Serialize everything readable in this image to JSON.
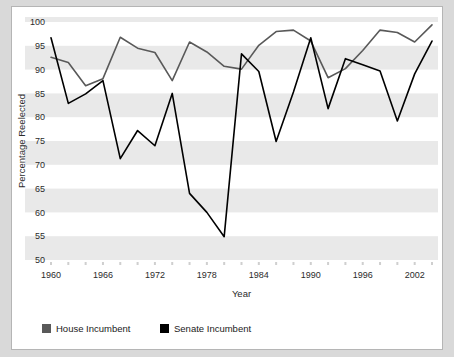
{
  "chart_data": {
    "type": "line",
    "title": "",
    "xlabel": "Year",
    "ylabel": "Percentage Reelected",
    "xlim": [
      1960,
      2004
    ],
    "ylim": [
      50,
      100
    ],
    "yticks": [
      50,
      55,
      60,
      65,
      70,
      75,
      80,
      85,
      90,
      95,
      100
    ],
    "xticks": [
      1960,
      1962,
      1964,
      1966,
      1968,
      1970,
      1972,
      1974,
      1976,
      1978,
      1980,
      1982,
      1984,
      1986,
      1988,
      1990,
      1992,
      1994,
      1996,
      1998,
      2000,
      2002,
      2004
    ],
    "xticklabels": [
      "1960",
      "",
      "",
      "1966",
      "",
      "",
      "1972",
      "",
      "",
      "1978",
      "",
      "",
      "1984",
      "",
      "",
      "1990",
      "",
      "",
      "1996",
      "",
      "",
      "2002",
      ""
    ],
    "grid": "horizontal-bands",
    "legend_position": "bottom-left",
    "x": [
      1960,
      1962,
      1964,
      1966,
      1968,
      1970,
      1972,
      1974,
      1976,
      1978,
      1980,
      1982,
      1984,
      1986,
      1988,
      1990,
      1992,
      1994,
      1996,
      1998,
      2000,
      2002,
      2004
    ],
    "series": [
      {
        "name": "House Incumbent",
        "color": "#595959",
        "values": [
          92.6,
          91.5,
          86.6,
          88.1,
          96.8,
          94.5,
          93.6,
          87.7,
          95.8,
          93.7,
          90.7,
          90.1,
          95.1,
          98.0,
          98.3,
          96.0,
          88.3,
          90.2,
          94.0,
          98.3,
          97.8,
          95.8,
          99.4
        ]
      },
      {
        "name": "Senate Incumbent",
        "color": "#000000",
        "values": [
          96.7,
          82.9,
          84.9,
          87.7,
          71.3,
          77.2,
          74.0,
          85.0,
          64.0,
          60.0,
          54.9,
          93.3,
          89.6,
          74.9,
          85.3,
          96.7,
          81.8,
          92.3,
          91.0,
          89.7,
          79.2,
          89.1,
          96.0
        ]
      }
    ]
  },
  "legend": {
    "items": [
      {
        "label": "House Incumbent",
        "color": "#595959"
      },
      {
        "label": "Senate Incumbent",
        "color": "#000000"
      }
    ]
  },
  "axis": {
    "x_title": "Year",
    "y_title": "Percentage Reelected"
  }
}
